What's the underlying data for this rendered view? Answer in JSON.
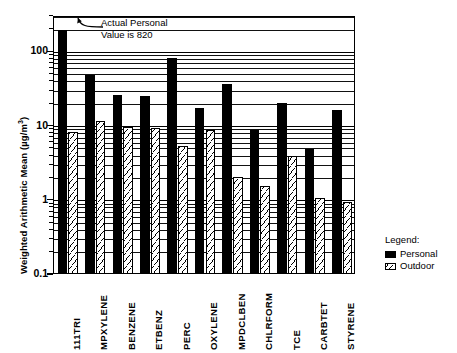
{
  "chart_data": {
    "type": "bar",
    "title": "",
    "subtitle": "",
    "xlabel": "",
    "ylabel": "Weighted Arithmetic Mean (µg/m",
    "ylabel_exponent": "3",
    "ylabel_suffix": ")",
    "yscale": "log",
    "ylim": [
      0.1,
      300
    ],
    "ytick_labels": [
      "0.1",
      "1",
      "10",
      "100"
    ],
    "ytick_values": [
      0.1,
      1,
      10,
      100
    ],
    "grid": true,
    "grid_style": "log-minor-horizontal",
    "legend_position": "right-outside",
    "categories": [
      "111TRI",
      "MPXYLENE",
      "BENZENE",
      "ETBENZ",
      "PERC",
      "OXYLENE",
      "MPDCLBEN",
      "CHLRFORM",
      "TCE",
      "CARBTET",
      "STYRENE"
    ],
    "series": [
      {
        "name": "Personal",
        "color": "#000000",
        "fill": "solid-black",
        "values": [
          200,
          50,
          27,
          26,
          85,
          18,
          37,
          9,
          21,
          5,
          17
        ]
      },
      {
        "name": "Outdoor",
        "color": "#ffffff",
        "fill": "hatched-white",
        "values": [
          8.5,
          12,
          10,
          9.5,
          5.5,
          9,
          2.1,
          1.6,
          4,
          1.1,
          0.95
        ]
      }
    ],
    "annotations": [
      {
        "text": "Actual Personal\nValue is 820",
        "target_category": "111TRI",
        "target_series": "Personal",
        "actual_value": 820,
        "arrow": true
      }
    ]
  },
  "legend": {
    "title": "Legend:",
    "entries": [
      {
        "label": "Personal",
        "swatch": "solid-black"
      },
      {
        "label": "Outdoor",
        "swatch": "hatched-white"
      }
    ]
  },
  "colors": {
    "personal": "#000000",
    "outdoor": "#ffffff",
    "axis": "#000000",
    "background": "#ffffff"
  }
}
